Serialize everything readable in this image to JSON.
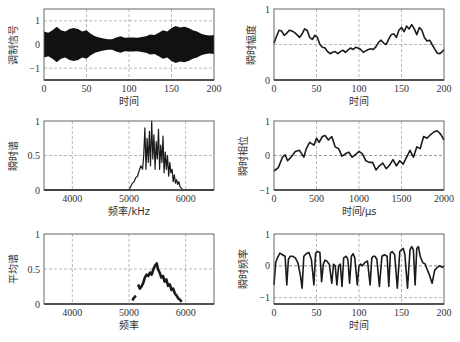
{
  "chart_data": [
    {
      "id": "modulated-signal",
      "type": "area",
      "ylabel": "调制信号",
      "xlabel": "时间",
      "xlim": [
        0,
        200
      ],
      "ylim": [
        -1.5,
        1.5
      ],
      "xticks": [
        0,
        50,
        100,
        150,
        200
      ],
      "yticks": [
        -1,
        0,
        1
      ],
      "ytick_labels": [
        "−1",
        "0",
        "1"
      ],
      "grid": true,
      "box": {
        "x": 44,
        "y": 9,
        "w": 170,
        "h": 71
      },
      "envelope": {
        "x": [
          0,
          5,
          10,
          15,
          20,
          25,
          30,
          35,
          40,
          45,
          50,
          55,
          60,
          65,
          70,
          75,
          80,
          85,
          90,
          95,
          100,
          105,
          110,
          115,
          120,
          125,
          130,
          135,
          140,
          145,
          150,
          155,
          160,
          165,
          170,
          175,
          180,
          185,
          190,
          195,
          200
        ],
        "y": [
          0.55,
          0.5,
          0.6,
          0.75,
          0.6,
          0.55,
          0.65,
          0.7,
          0.65,
          0.55,
          0.6,
          0.45,
          0.35,
          0.3,
          0.25,
          0.22,
          0.22,
          0.3,
          0.35,
          0.28,
          0.3,
          0.3,
          0.28,
          0.32,
          0.35,
          0.42,
          0.4,
          0.5,
          0.6,
          0.55,
          0.7,
          0.78,
          0.72,
          0.75,
          0.7,
          0.6,
          0.55,
          0.45,
          0.4,
          0.38,
          0.4
        ]
      }
    },
    {
      "id": "instantaneous-amplitude",
      "type": "line",
      "ylabel": "瞬时幅度",
      "xlabel": "时间",
      "xlim": [
        0,
        200
      ],
      "ylim": [
        0,
        1
      ],
      "xticks": [
        0,
        50,
        100,
        150,
        200
      ],
      "yticks": [
        0,
        1
      ],
      "ytick_labels": [
        "0",
        "1"
      ],
      "hline": 0.5,
      "grid": true,
      "box": {
        "x": 274,
        "y": 9,
        "w": 170,
        "h": 71
      },
      "x": [
        0,
        3,
        6,
        9,
        12,
        15,
        18,
        21,
        24,
        27,
        30,
        33,
        36,
        39,
        42,
        45,
        48,
        51,
        54,
        57,
        60,
        63,
        66,
        69,
        72,
        75,
        78,
        81,
        84,
        87,
        90,
        93,
        96,
        99,
        102,
        105,
        108,
        111,
        114,
        117,
        120,
        123,
        126,
        129,
        132,
        135,
        138,
        141,
        144,
        147,
        150,
        153,
        156,
        159,
        162,
        165,
        168,
        171,
        174,
        177,
        180,
        183,
        186,
        189,
        192,
        195,
        198,
        200
      ],
      "y": [
        0.52,
        0.62,
        0.7,
        0.69,
        0.63,
        0.66,
        0.7,
        0.69,
        0.67,
        0.64,
        0.6,
        0.65,
        0.72,
        0.7,
        0.6,
        0.57,
        0.63,
        0.6,
        0.5,
        0.46,
        0.45,
        0.4,
        0.37,
        0.39,
        0.4,
        0.37,
        0.4,
        0.42,
        0.39,
        0.42,
        0.45,
        0.43,
        0.46,
        0.45,
        0.43,
        0.39,
        0.41,
        0.43,
        0.44,
        0.43,
        0.47,
        0.53,
        0.56,
        0.52,
        0.5,
        0.58,
        0.64,
        0.65,
        0.6,
        0.7,
        0.74,
        0.68,
        0.76,
        0.72,
        0.78,
        0.72,
        0.64,
        0.74,
        0.7,
        0.6,
        0.55,
        0.56,
        0.5,
        0.44,
        0.38,
        0.37,
        0.4,
        0.43
      ]
    },
    {
      "id": "instantaneous-spectrum",
      "type": "line",
      "ylabel": "瞬时谱",
      "xlabel": "频率/kHz",
      "xlim": [
        3500,
        6500
      ],
      "ylim": [
        0,
        1
      ],
      "xticks": [
        4000,
        5000,
        6000
      ],
      "yticks": [
        0,
        0.5,
        1
      ],
      "ytick_labels": [
        "0",
        "0.5",
        "1"
      ],
      "grid": true,
      "box": {
        "x": 44,
        "y": 121,
        "w": 170,
        "h": 69
      },
      "x": [
        3500,
        5000,
        5030,
        5060,
        5090,
        5120,
        5150,
        5180,
        5210,
        5240,
        5260,
        5280,
        5300,
        5320,
        5340,
        5360,
        5380,
        5400,
        5420,
        5440,
        5460,
        5480,
        5500,
        5520,
        5540,
        5560,
        5580,
        5600,
        5620,
        5640,
        5660,
        5680,
        5700,
        5720,
        5740,
        5760,
        5780,
        5800,
        5820,
        5840,
        5860,
        5880,
        5900,
        5930,
        5960,
        6500
      ],
      "y": [
        0,
        0,
        0.05,
        0.1,
        0.12,
        0.18,
        0.2,
        0.28,
        0.35,
        0.3,
        0.5,
        0.9,
        0.3,
        0.75,
        0.4,
        0.85,
        0.35,
        1.0,
        0.45,
        0.8,
        0.3,
        0.7,
        0.45,
        0.88,
        0.3,
        0.65,
        0.4,
        0.78,
        0.25,
        0.55,
        0.3,
        0.5,
        0.2,
        0.4,
        0.25,
        0.3,
        0.12,
        0.22,
        0.1,
        0.15,
        0.08,
        0.12,
        0.05,
        0.02,
        0,
        0
      ]
    },
    {
      "id": "instantaneous-phase",
      "type": "line",
      "ylabel": "瞬时相位",
      "xlabel": "时间/μs",
      "xlim": [
        0,
        2000
      ],
      "ylim": [
        -1,
        1
      ],
      "xticks": [
        0,
        500,
        1000,
        1500,
        2000
      ],
      "yticks": [
        -1,
        0,
        1
      ],
      "ytick_labels": [
        "−1",
        "0",
        "1"
      ],
      "hline": 0,
      "grid": true,
      "box": {
        "x": 274,
        "y": 121,
        "w": 170,
        "h": 69
      },
      "x": [
        0,
        50,
        100,
        130,
        160,
        200,
        250,
        300,
        350,
        380,
        420,
        470,
        500,
        530,
        570,
        600,
        640,
        680,
        720,
        760,
        800,
        840,
        880,
        920,
        960,
        1000,
        1040,
        1080,
        1120,
        1160,
        1200,
        1240,
        1280,
        1320,
        1360,
        1400,
        1440,
        1480,
        1520,
        1560,
        1600,
        1640,
        1680,
        1720,
        1760,
        1800,
        1840,
        1880,
        1920,
        1960,
        2000
      ],
      "y": [
        -0.45,
        -0.35,
        -0.05,
        0.02,
        -0.15,
        -0.05,
        0.12,
        0.15,
        -0.05,
        0.2,
        0.38,
        0.3,
        0.5,
        0.38,
        0.55,
        0.58,
        0.45,
        0.55,
        0.25,
        0.2,
        -0.02,
        0.05,
        0.1,
        -0.05,
        0.03,
        0.12,
        0.05,
        -0.15,
        -0.2,
        -0.2,
        -0.42,
        -0.3,
        -0.22,
        -0.38,
        -0.28,
        -0.12,
        -0.3,
        -0.15,
        -0.25,
        -0.05,
        0.15,
        -0.05,
        0.25,
        0.2,
        0.55,
        0.5,
        0.6,
        0.68,
        0.72,
        0.62,
        0.45
      ]
    },
    {
      "id": "average-spectrum",
      "type": "line",
      "ylabel": "平均谱",
      "xlabel": "频率",
      "xlim": [
        3500,
        6500
      ],
      "ylim": [
        0,
        1
      ],
      "xticks": [
        4000,
        5000,
        6000
      ],
      "yticks": [
        0,
        0.5,
        1
      ],
      "ytick_labels": [
        "0",
        "0.5",
        "1"
      ],
      "grid": true,
      "box": {
        "x": 44,
        "y": 234,
        "w": 170,
        "h": 70
      },
      "segments": [
        {
          "x": [
            5060,
            5080,
            5100,
            5120
          ],
          "y": [
            0.05,
            0.08,
            0.1,
            0.12
          ]
        },
        {
          "x": [
            5160,
            5190,
            5220,
            5250,
            5280,
            5310,
            5340,
            5370,
            5400,
            5430,
            5460,
            5490,
            5510,
            5540,
            5570,
            5600,
            5630,
            5660,
            5690,
            5720,
            5750,
            5780,
            5810,
            5840,
            5870,
            5900,
            5930
          ],
          "y": [
            0.28,
            0.22,
            0.25,
            0.3,
            0.38,
            0.42,
            0.4,
            0.45,
            0.42,
            0.5,
            0.55,
            0.58,
            0.5,
            0.45,
            0.38,
            0.4,
            0.32,
            0.35,
            0.26,
            0.28,
            0.2,
            0.22,
            0.15,
            0.12,
            0.08,
            0.06,
            0.03
          ]
        }
      ]
    },
    {
      "id": "instantaneous-frequency",
      "type": "line",
      "ylabel": "瞬时频率",
      "xlabel": "时间",
      "xlim": [
        0,
        200
      ],
      "ylim": [
        -1.2,
        1
      ],
      "xticks": [
        0,
        50,
        100,
        150,
        200
      ],
      "yticks": [
        -1,
        0,
        1
      ],
      "ytick_labels": [
        "−1",
        "0",
        "1"
      ],
      "hline": 0,
      "grid": true,
      "box": {
        "x": 274,
        "y": 234,
        "w": 170,
        "h": 70
      },
      "x": [
        0,
        2,
        4,
        7,
        10,
        13,
        15,
        17,
        19,
        22,
        25,
        28,
        31,
        33,
        35,
        38,
        41,
        44,
        47,
        49,
        51,
        54,
        56,
        58,
        60,
        62,
        65,
        68,
        70,
        72,
        74,
        76,
        78,
        80,
        82,
        85,
        87,
        89,
        91,
        93,
        95,
        98,
        100,
        102,
        104,
        107,
        110,
        113,
        115,
        117,
        119,
        121,
        124,
        127,
        130,
        133,
        135,
        137,
        139,
        142,
        145,
        148,
        150,
        152,
        154,
        157,
        160,
        162,
        164,
        166,
        168,
        170,
        172,
        175,
        178,
        180,
        183,
        186,
        189,
        192,
        195,
        198,
        200
      ],
      "y": [
        -0.6,
        0.1,
        0.25,
        0.4,
        0.35,
        0.3,
        -0.6,
        0.2,
        0.3,
        0.3,
        0.25,
        0.1,
        -0.3,
        -0.7,
        0.3,
        0.38,
        0.42,
        0.2,
        -0.6,
        0.4,
        0.45,
        0.42,
        -0.5,
        0.05,
        0.18,
        0.15,
        0.05,
        -0.55,
        0.05,
        0.0,
        -0.6,
        0.0,
        0.05,
        -0.65,
        0.25,
        0.3,
        0.2,
        -0.55,
        0.3,
        0.38,
        0.25,
        -0.6,
        0.0,
        0.05,
        0.0,
        0.1,
        0.15,
        -0.6,
        0.25,
        0.3,
        0.3,
        0.2,
        -0.65,
        0.3,
        0.35,
        0.3,
        -0.65,
        0.4,
        0.45,
        0.35,
        -0.7,
        0.45,
        0.5,
        0.55,
        0.35,
        -0.7,
        0.5,
        0.6,
        0.5,
        -0.6,
        0.55,
        0.6,
        0.3,
        0.1,
        0.05,
        -0.1,
        -0.3,
        -0.55,
        -0.15,
        -0.05,
        0.0,
        -0.05,
        0.0
      ]
    }
  ]
}
